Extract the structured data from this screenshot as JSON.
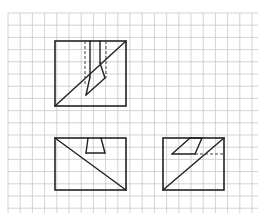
{
  "figure": {
    "width": 265,
    "height": 219
  },
  "grid": {
    "x0": 8,
    "y0": 13,
    "x1": 258,
    "y1": 213,
    "spacing": 12.2,
    "color": "#c8c8c8"
  },
  "colors": {
    "line": "#222222",
    "hidden": "#444444",
    "background": "#ffffff"
  },
  "views": {
    "top": {
      "label": "top-view",
      "rect": [
        55,
        41,
        126,
        106
      ],
      "solid": [
        [
          [
            55,
            106
          ],
          [
            126,
            41
          ]
        ],
        [
          [
            90,
            41
          ],
          [
            90,
            77
          ]
        ],
        [
          [
            90,
            77
          ],
          [
            86,
            95
          ]
        ],
        [
          [
            86,
            95
          ],
          [
            105,
            78
          ]
        ],
        [
          [
            105,
            78
          ],
          [
            100,
            63
          ]
        ],
        [
          [
            100,
            63
          ],
          [
            100,
            41
          ]
        ]
      ],
      "hidden": [
        [
          [
            85,
            41
          ],
          [
            85,
            84
          ]
        ],
        [
          [
            106,
            41
          ],
          [
            106,
            78
          ]
        ]
      ]
    },
    "front": {
      "label": "front-view",
      "rect": [
        55,
        138,
        126,
        190
      ],
      "solid": [
        [
          [
            55,
            138
          ],
          [
            126,
            190
          ]
        ],
        [
          [
            88,
            138
          ],
          [
            86,
            153
          ]
        ],
        [
          [
            86,
            153
          ],
          [
            105,
            153
          ]
        ],
        [
          [
            105,
            153
          ],
          [
            101,
            138
          ]
        ]
      ],
      "hidden": []
    },
    "side": {
      "label": "side-view",
      "rect": [
        163,
        138,
        224,
        190
      ],
      "solid": [
        [
          [
            163,
            190
          ],
          [
            224,
            138
          ]
        ],
        [
          [
            172,
            154
          ],
          [
            190,
            138
          ]
        ],
        [
          [
            190,
            138
          ],
          [
            202,
            138
          ]
        ],
        [
          [
            202,
            138
          ],
          [
            195,
            154
          ]
        ],
        [
          [
            195,
            154
          ],
          [
            172,
            154
          ]
        ]
      ],
      "hidden": [
        [
          [
            195,
            154
          ],
          [
            224,
            154
          ]
        ]
      ]
    }
  }
}
